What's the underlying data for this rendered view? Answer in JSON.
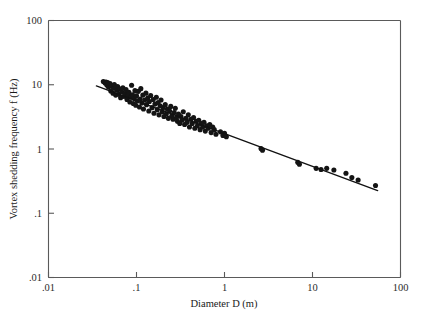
{
  "figure": {
    "title": "",
    "background": "#ffffff",
    "ink_color": "#141414",
    "axis_color": "#5a5a5a"
  },
  "axes": {
    "x_title": "Diameter D (m)",
    "y_title": "Vortex shedding frequency f (Hz)",
    "x_tick_labels": [
      ".01",
      ".1",
      "1",
      "10",
      "100"
    ],
    "y_tick_labels": [
      "100",
      "10",
      "1",
      ".1",
      ".01"
    ]
  },
  "chart_data": {
    "type": "scatter",
    "title": "",
    "xlabel": "Diameter D (m)",
    "ylabel": "Vortex shedding frequency f (Hz)",
    "xscale": "log",
    "yscale": "log",
    "xlim": [
      0.01,
      100
    ],
    "ylim": [
      0.01,
      100
    ],
    "xticks": [
      0.01,
      0.1,
      1,
      10,
      100
    ],
    "xticklabels": [
      ".01",
      ".1",
      "1",
      "10",
      "100"
    ],
    "yticks": [
      0.01,
      0.1,
      1,
      10,
      100
    ],
    "yticklabels": [
      ".01",
      ".1",
      "1",
      "10",
      "100"
    ],
    "grid": false,
    "legend": null,
    "marker": "filled-circle",
    "marker_size_px": 3.1,
    "series": [
      {
        "name": "Measured vortex shedding data",
        "type": "scatter",
        "points": [
          [
            0.042,
            11.2
          ],
          [
            0.044,
            10.6
          ],
          [
            0.045,
            11.0
          ],
          [
            0.046,
            9.9
          ],
          [
            0.047,
            10.8
          ],
          [
            0.048,
            9.2
          ],
          [
            0.05,
            10.4
          ],
          [
            0.051,
            8.0
          ],
          [
            0.052,
            9.6
          ],
          [
            0.054,
            7.4
          ],
          [
            0.055,
            8.8
          ],
          [
            0.056,
            10.1
          ],
          [
            0.058,
            6.9
          ],
          [
            0.06,
            8.2
          ],
          [
            0.061,
            9.4
          ],
          [
            0.063,
            7.1
          ],
          [
            0.065,
            8.6
          ],
          [
            0.066,
            6.3
          ],
          [
            0.068,
            7.8
          ],
          [
            0.07,
            9.0
          ],
          [
            0.072,
            6.6
          ],
          [
            0.074,
            7.3
          ],
          [
            0.076,
            8.4
          ],
          [
            0.078,
            5.9
          ],
          [
            0.08,
            6.8
          ],
          [
            0.082,
            7.6
          ],
          [
            0.084,
            5.4
          ],
          [
            0.086,
            6.4
          ],
          [
            0.088,
            9.8
          ],
          [
            0.09,
            7.0
          ],
          [
            0.092,
            5.1
          ],
          [
            0.094,
            6.1
          ],
          [
            0.096,
            8.1
          ],
          [
            0.098,
            4.8
          ],
          [
            0.1,
            6.7
          ],
          [
            0.102,
            5.6
          ],
          [
            0.105,
            7.9
          ],
          [
            0.108,
            4.5
          ],
          [
            0.11,
            6.0
          ],
          [
            0.112,
            8.7
          ],
          [
            0.115,
            5.2
          ],
          [
            0.118,
            6.9
          ],
          [
            0.12,
            4.2
          ],
          [
            0.124,
            5.8
          ],
          [
            0.128,
            7.4
          ],
          [
            0.13,
            4.9
          ],
          [
            0.134,
            6.2
          ],
          [
            0.138,
            3.9
          ],
          [
            0.14,
            5.5
          ],
          [
            0.145,
            6.8
          ],
          [
            0.15,
            4.4
          ],
          [
            0.155,
            5.9
          ],
          [
            0.158,
            3.6
          ],
          [
            0.162,
            5.0
          ],
          [
            0.168,
            6.4
          ],
          [
            0.172,
            4.1
          ],
          [
            0.176,
            5.3
          ],
          [
            0.18,
            3.4
          ],
          [
            0.185,
            4.7
          ],
          [
            0.19,
            5.8
          ],
          [
            0.196,
            3.8
          ],
          [
            0.2,
            4.4
          ],
          [
            0.205,
            3.2
          ],
          [
            0.212,
            4.9
          ],
          [
            0.218,
            3.5
          ],
          [
            0.224,
            4.2
          ],
          [
            0.23,
            3.0
          ],
          [
            0.238,
            3.9
          ],
          [
            0.245,
            4.6
          ],
          [
            0.252,
            3.3
          ],
          [
            0.26,
            2.9
          ],
          [
            0.268,
            3.7
          ],
          [
            0.276,
            4.3
          ],
          [
            0.285,
            3.1
          ],
          [
            0.292,
            2.7
          ],
          [
            0.3,
            3.5
          ],
          [
            0.31,
            2.5
          ],
          [
            0.32,
            3.2
          ],
          [
            0.33,
            2.8
          ],
          [
            0.34,
            3.8
          ],
          [
            0.352,
            2.4
          ],
          [
            0.364,
            3.0
          ],
          [
            0.376,
            2.6
          ],
          [
            0.388,
            3.4
          ],
          [
            0.4,
            2.2
          ],
          [
            0.415,
            2.9
          ],
          [
            0.43,
            2.5
          ],
          [
            0.445,
            3.1
          ],
          [
            0.46,
            2.1
          ],
          [
            0.476,
            2.7
          ],
          [
            0.492,
            2.3
          ],
          [
            0.51,
            2.8
          ],
          [
            0.528,
            2.0
          ],
          [
            0.546,
            2.5
          ],
          [
            0.565,
            2.2
          ],
          [
            0.585,
            2.6
          ],
          [
            0.605,
            1.9
          ],
          [
            0.63,
            2.3
          ],
          [
            0.655,
            2.1
          ],
          [
            0.68,
            2.4
          ],
          [
            0.705,
            1.8
          ],
          [
            0.735,
            2.2
          ],
          [
            0.765,
            2.0
          ],
          [
            0.8,
            1.7
          ],
          [
            0.9,
            1.85
          ],
          [
            0.96,
            1.62
          ],
          [
            1.0,
            1.75
          ],
          [
            1.05,
            1.55
          ],
          [
            2.6,
            1.02
          ],
          [
            2.7,
            0.96
          ],
          [
            6.8,
            0.62
          ],
          [
            7.1,
            0.58
          ],
          [
            11.0,
            0.5
          ],
          [
            12.5,
            0.48
          ],
          [
            14.5,
            0.5
          ],
          [
            17.5,
            0.47
          ],
          [
            24.0,
            0.42
          ],
          [
            28.0,
            0.36
          ],
          [
            33.0,
            0.33
          ],
          [
            52.0,
            0.27
          ]
        ]
      },
      {
        "name": "Power-law fit",
        "type": "line",
        "endpoints": [
          [
            0.035,
            9.6
          ],
          [
            55.0,
            0.225
          ]
        ],
        "relation": "f proportional to D^-0.5"
      }
    ]
  }
}
